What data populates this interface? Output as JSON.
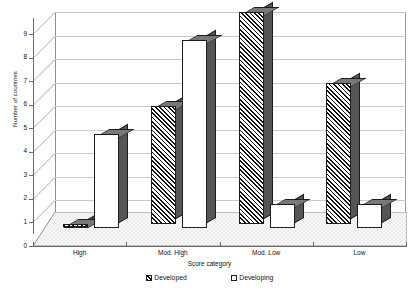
{
  "chart_data": {
    "type": "bar",
    "title": "",
    "xlabel": "Score category",
    "ylabel": "Number of countries",
    "categories": [
      "High",
      "Mod. High",
      "Mod. Low",
      "Low"
    ],
    "series": [
      {
        "name": "Developed",
        "values": [
          0,
          5,
          9,
          6
        ],
        "pattern": "hatched"
      },
      {
        "name": "Developing",
        "values": [
          4,
          8,
          1,
          1
        ],
        "pattern": "solid-white"
      }
    ],
    "ylim": [
      0,
      9
    ],
    "yticks": [
      0,
      1,
      2,
      3,
      4,
      5,
      6,
      7,
      8,
      9
    ],
    "ytick_labels": [
      "0",
      "1",
      "2",
      "3",
      "4",
      "5",
      "6",
      "7",
      "8",
      "9"
    ],
    "grid": true,
    "grid_axis": "y",
    "legend_position": "bottom",
    "style": "3d-column",
    "colors": {
      "bar_outline": "#1d1d1d",
      "bar_top_face": "#787878",
      "bar_side_face": "#555555",
      "gridline": "#c9c9c9",
      "axis": "#6b6b6b",
      "floor": "#f2f2f2",
      "background": "#ffffff",
      "text": "#111111"
    }
  },
  "axes": {
    "y_title": "Number of countries",
    "x_title": "Score category",
    "y_ticks": [
      "0",
      "1",
      "2",
      "3",
      "4",
      "5",
      "6",
      "7",
      "8",
      "9"
    ],
    "x_ticks": [
      "High",
      "Mod. High",
      "Mod. Low",
      "Low"
    ]
  },
  "legend": {
    "items": [
      {
        "label": "Developed",
        "swatch": "hatched-square-icon"
      },
      {
        "label": "Developing",
        "swatch": "white-square-icon"
      }
    ]
  }
}
